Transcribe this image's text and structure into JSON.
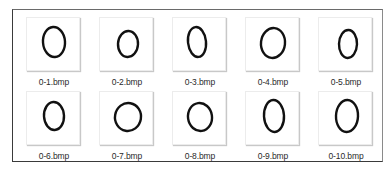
{
  "gallery": {
    "items": [
      {
        "label": "0-1.bmp",
        "icon": "bmp-thumbnail-digit-zero",
        "shape": {
          "cx": 27,
          "cy": 24,
          "rx": 11,
          "ry": 15,
          "rot": -4
        }
      },
      {
        "label": "0-2.bmp",
        "icon": "bmp-thumbnail-digit-zero",
        "shape": {
          "cx": 28,
          "cy": 26,
          "rx": 10,
          "ry": 13,
          "rot": 3
        }
      },
      {
        "label": "0-3.bmp",
        "icon": "bmp-thumbnail-digit-zero",
        "shape": {
          "cx": 24,
          "cy": 24,
          "rx": 9,
          "ry": 15,
          "rot": -6
        }
      },
      {
        "label": "0-4.bmp",
        "icon": "bmp-thumbnail-digit-zero",
        "shape": {
          "cx": 27,
          "cy": 25,
          "rx": 12,
          "ry": 15,
          "rot": 6
        }
      },
      {
        "label": "0-5.bmp",
        "icon": "bmp-thumbnail-digit-zero",
        "shape": {
          "cx": 29,
          "cy": 26,
          "rx": 9,
          "ry": 14,
          "rot": 2
        }
      },
      {
        "label": "0-6.bmp",
        "icon": "bmp-thumbnail-digit-zero",
        "shape": {
          "cx": 27,
          "cy": 24,
          "rx": 10,
          "ry": 14,
          "rot": -3
        }
      },
      {
        "label": "0-7.bmp",
        "icon": "bmp-thumbnail-digit-zero",
        "shape": {
          "cx": 28,
          "cy": 25,
          "rx": 13,
          "ry": 14,
          "rot": 10
        }
      },
      {
        "label": "0-8.bmp",
        "icon": "bmp-thumbnail-digit-zero",
        "shape": {
          "cx": 27,
          "cy": 25,
          "rx": 12,
          "ry": 14,
          "rot": -8
        }
      },
      {
        "label": "0-9.bmp",
        "icon": "bmp-thumbnail-digit-zero",
        "shape": {
          "cx": 28,
          "cy": 24,
          "rx": 10,
          "ry": 16,
          "rot": -3
        }
      },
      {
        "label": "0-10.bmp",
        "icon": "bmp-thumbnail-digit-zero",
        "shape": {
          "cx": 28,
          "cy": 24,
          "rx": 11,
          "ry": 16,
          "rot": 2
        }
      }
    ]
  }
}
